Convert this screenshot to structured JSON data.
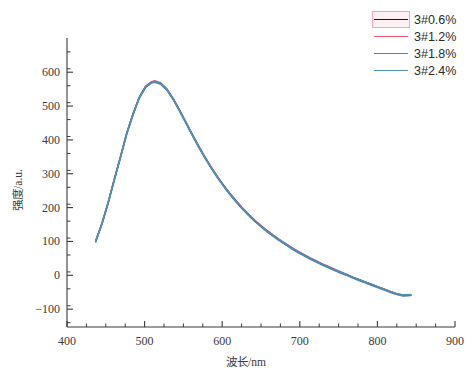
{
  "chart_data": {
    "type": "line",
    "title": "",
    "xlabel": "波长/nm",
    "ylabel": "强度/a.u.",
    "xlim": [
      400,
      900
    ],
    "ylim": [
      -140,
      660
    ],
    "xticks": [
      400,
      500,
      600,
      700,
      800,
      900
    ],
    "yticks": [
      -100,
      0,
      100,
      200,
      300,
      400,
      500,
      600
    ],
    "xtick_labels": [
      "400",
      "500",
      "600",
      "700",
      "800",
      "900"
    ],
    "ytick_labels": [
      "−100",
      "0",
      "100",
      "200",
      "300",
      "400",
      "500",
      "600"
    ],
    "minor_ticks": true,
    "grid": false,
    "legend_position": "top-right",
    "x": [
      437,
      445,
      453,
      461,
      469,
      477,
      485,
      493,
      501,
      509,
      513,
      521,
      529,
      537,
      545,
      553,
      561,
      569,
      577,
      585,
      593,
      601,
      609,
      617,
      625,
      633,
      641,
      649,
      657,
      665,
      673,
      681,
      689,
      697,
      705,
      713,
      721,
      729,
      737,
      745,
      753,
      761,
      769,
      777,
      785,
      793,
      801,
      809,
      817,
      825,
      833,
      843
    ],
    "series": [
      {
        "name": "3#0.6%",
        "color": "#1a1a1a",
        "values": [
          100,
          152,
          214,
          283,
          350,
          419,
          475,
          524,
          556,
          570,
          572,
          566,
          548,
          520,
          487,
          452,
          417,
          383,
          351,
          321,
          293,
          267,
          243,
          221,
          200,
          181,
          163,
          147,
          132,
          118,
          105,
          93,
          81,
          70,
          60,
          50,
          41,
          32,
          24,
          16,
          8,
          1,
          -7,
          -14,
          -21,
          -28,
          -35,
          -42,
          -49,
          -55,
          -59,
          -58
        ]
      },
      {
        "name": "3#1.2%",
        "color": "#f0556e",
        "values": [
          101,
          153,
          215,
          284,
          351,
          420,
          477,
          526,
          558,
          572,
          575,
          568,
          550,
          522,
          489,
          454,
          419,
          385,
          353,
          323,
          295,
          269,
          245,
          223,
          202,
          183,
          165,
          149,
          134,
          120,
          107,
          95,
          83,
          72,
          62,
          52,
          43,
          34,
          26,
          18,
          10,
          2,
          -6,
          -13,
          -20,
          -27,
          -34,
          -41,
          -48,
          -55,
          -60,
          -59
        ]
      },
      {
        "name": "3#1.8%",
        "color": "#5a7fb0",
        "values": [
          99,
          151,
          212,
          281,
          348,
          417,
          473,
          522,
          554,
          568,
          570,
          564,
          546,
          518,
          485,
          450,
          415,
          381,
          349,
          319,
          291,
          265,
          241,
          219,
          198,
          179,
          161,
          145,
          130,
          116,
          103,
          91,
          79,
          68,
          58,
          48,
          39,
          30,
          22,
          14,
          6,
          -1,
          -9,
          -16,
          -23,
          -30,
          -37,
          -44,
          -51,
          -57,
          -61,
          -60
        ]
      },
      {
        "name": "3#2.4%",
        "color": "#4f93b8",
        "values": [
          102,
          154,
          216,
          285,
          352,
          421,
          476,
          525,
          557,
          571,
          573,
          567,
          549,
          521,
          488,
          453,
          418,
          384,
          352,
          322,
          294,
          268,
          244,
          222,
          201,
          182,
          164,
          148,
          133,
          119,
          106,
          94,
          82,
          71,
          61,
          51,
          42,
          33,
          25,
          17,
          9,
          2,
          -6,
          -13,
          -20,
          -27,
          -34,
          -41,
          -48,
          -54,
          -58,
          -57
        ]
      }
    ]
  },
  "legend": {
    "items": [
      {
        "label": "3#0.6%",
        "color": "#1a1a1a",
        "selected": true
      },
      {
        "label": "3#1.2%",
        "color": "#f0556e",
        "selected": false
      },
      {
        "label": "3#1.8%",
        "color": "#5a7fb0",
        "selected": false
      },
      {
        "label": "3#2.4%",
        "color": "#4f93b8",
        "selected": false
      }
    ]
  },
  "axes": {
    "x_label": "波长/nm",
    "y_label": "强度/a.u.",
    "x_tick_labels": [
      "400",
      "500",
      "600",
      "700",
      "800",
      "900"
    ],
    "y_tick_labels": [
      "600",
      "500",
      "400",
      "300",
      "200",
      "100",
      "0",
      "−100"
    ]
  }
}
